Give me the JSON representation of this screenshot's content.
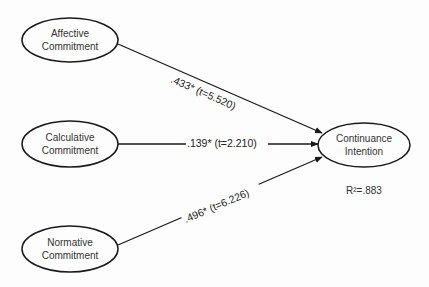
{
  "diagram": {
    "type": "structural-path-model",
    "nodes": [
      {
        "id": "affective",
        "line1": "Affective",
        "line2": "Commitment"
      },
      {
        "id": "calculative",
        "line1": "Calculative",
        "line2": "Commitment"
      },
      {
        "id": "normative",
        "line1": "Normative",
        "line2": "Commitment"
      },
      {
        "id": "continuance",
        "line1": "Continuance",
        "line2": "Intention"
      }
    ],
    "edges": [
      {
        "from": "affective",
        "to": "continuance",
        "label": ".433* (t=5.520)"
      },
      {
        "from": "calculative",
        "to": "continuance",
        "label": ".139* (t=2.210)"
      },
      {
        "from": "normative",
        "to": "continuance",
        "label": ".496* (t=6.226)"
      }
    ],
    "r_squared": "R²=.883",
    "colors": {
      "stroke": "#1a1a1a",
      "text": "#333333",
      "background": "#fdfdfd"
    }
  }
}
